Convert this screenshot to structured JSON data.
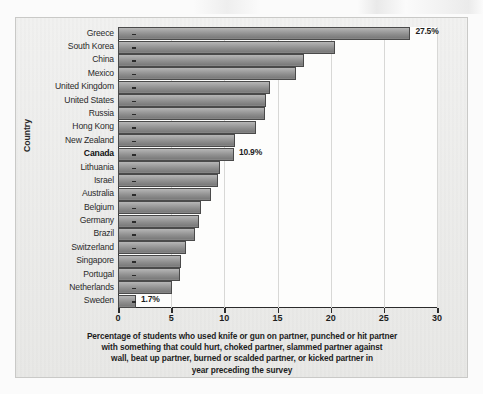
{
  "chart_data": {
    "type": "bar",
    "orientation": "horizontal",
    "title": "",
    "xlabel": "Percentage of students who used knife or gun on partner, punched or hit partner with something that could hurt, choked partner, slammed partner against wall, beat up partner, burned or scalded partner, or kicked partner in year preceding the survey",
    "ylabel": "Country",
    "xlim": [
      0,
      30
    ],
    "xticks": [
      0,
      5,
      10,
      15,
      20,
      25,
      30
    ],
    "xtick_labels": [
      "0",
      "5",
      "10",
      "15",
      "20",
      "25",
      "30"
    ],
    "grid": "vertical",
    "legend": "none",
    "categories": [
      "Greece",
      "South Korea",
      "China",
      "Mexico",
      "United Kingdom",
      "United States",
      "Russia",
      "Hong Kong",
      "New Zealand",
      "Canada",
      "Lithuania",
      "Israel",
      "Australia",
      "Belgium",
      "Germany",
      "Brazil",
      "Switzerland",
      "Singapore",
      "Portugal",
      "Netherlands",
      "Sweden"
    ],
    "values": [
      27.5,
      20.4,
      17.5,
      16.7,
      14.3,
      13.9,
      13.8,
      13.0,
      11.0,
      10.9,
      9.6,
      9.4,
      8.7,
      7.8,
      7.6,
      7.2,
      6.4,
      5.9,
      5.8,
      5.1,
      1.7
    ],
    "annotations": [
      {
        "category": "Greece",
        "label": "27.5%"
      },
      {
        "category": "Canada",
        "label": "10.9%"
      },
      {
        "category": "Sweden",
        "label": "1.7%"
      }
    ],
    "highlighted_categories": [
      "Canada"
    ]
  },
  "caption": {
    "lines": [
      "Percentage of students who used knife or gun on partner, punched or hit partner",
      "with something that could hurt, choked partner, slammed partner against",
      "wall, beat up partner, burned or scalded partner, or kicked partner in",
      "year preceding the survey"
    ]
  },
  "colors": {
    "bar_fill": "#9a9a9a",
    "bar_border": "#4a4a4a",
    "axis": "#2b2b2b",
    "gridline": "#d8d8d6",
    "plot_background": "#fdfdfc",
    "page_background": "#ececeb",
    "text": "#1d1d1d"
  }
}
